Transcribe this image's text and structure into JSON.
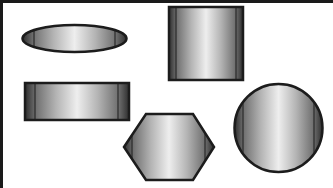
{
  "canvas": {
    "width": 333,
    "height": 188,
    "background": "#ffffff",
    "frame_color": "#1a1a1a"
  },
  "style": {
    "outline_color": "#1c1c1c",
    "gradient": [
      "#2e2e2e",
      "#7a7a7a",
      "#c4c4c4",
      "#f2f2f2",
      "#c4c4c4",
      "#7a7a7a",
      "#2e2e2e"
    ]
  },
  "shapes": [
    {
      "id": "ellipse",
      "type": "ellipse",
      "label": "Ellipse",
      "cx": 74.5,
      "cy": 38.5,
      "rx": 52,
      "ry": 13.5
    },
    {
      "id": "square",
      "type": "rect",
      "label": "Square",
      "x": 169,
      "y": 7,
      "w": 74,
      "h": 73
    },
    {
      "id": "rectangle",
      "type": "rect",
      "label": "Rectangle",
      "x": 25,
      "y": 83,
      "w": 104,
      "h": 37
    },
    {
      "id": "hexagon",
      "type": "hexagon",
      "label": "Hexagon",
      "points": "124,147 146,114 193,114 214,147 193,180 146,180"
    },
    {
      "id": "circle",
      "type": "circle",
      "label": "Circle",
      "cx": 278.5,
      "cy": 128,
      "r": 44
    }
  ]
}
